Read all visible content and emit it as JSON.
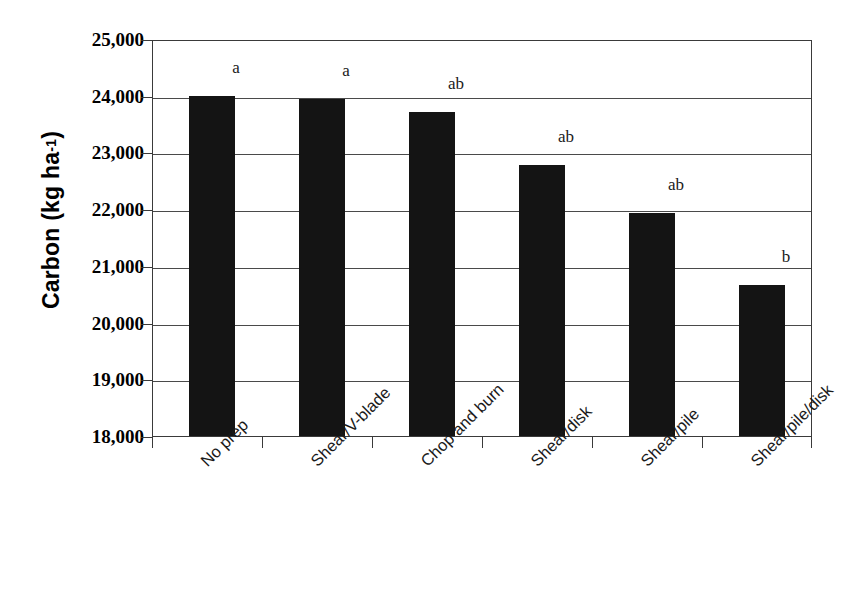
{
  "chart": {
    "type": "bar",
    "title": "",
    "xlabel": "",
    "ylabel_text": "Carbon (kg ha",
    "ylabel_sup": "-1",
    "ylabel_close": ")",
    "ylabel_full": "Carbon (kg ha-1)"
  },
  "chart_data": {
    "type": "bar",
    "title": "",
    "xlabel": "",
    "ylabel": "Carbon (kg ha-1)",
    "categories": [
      "No prep",
      "Shear/V-blade",
      "Chop and burn",
      "Shear/disk",
      "Shear/pile",
      "Shear/pile/disk"
    ],
    "values": [
      24000,
      23940,
      23710,
      22780,
      21940,
      20670
    ],
    "annotations": [
      "a",
      "a",
      "ab",
      "ab",
      "ab",
      "b"
    ],
    "ylim": [
      18000,
      25000
    ],
    "yticks": [
      18000,
      19000,
      20000,
      21000,
      22000,
      23000,
      24000,
      25000
    ],
    "ytick_labels": [
      "18,000",
      "19,000",
      "20,000",
      "21,000",
      "22,000",
      "23,000",
      "24,000",
      "25,000"
    ],
    "grid": true,
    "legend": false,
    "bar_color": "#141414",
    "series": [
      {
        "name": "Carbon",
        "values": [
          24000,
          23940,
          23710,
          22780,
          21940,
          20670
        ]
      }
    ]
  }
}
